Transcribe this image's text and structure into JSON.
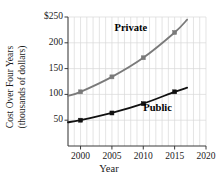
{
  "chart_data": {
    "type": "line",
    "title": "",
    "xlabel": "Year",
    "ylabel": "Cost Over Four Years (thousands of dollars)",
    "ylabel_line1": "Cost Over Four Years",
    "ylabel_line2": "(thousands of dollars)",
    "xlim": [
      1998,
      2020
    ],
    "ylim": [
      0,
      250
    ],
    "x_ticks": [
      2000,
      2005,
      2010,
      2015,
      2020
    ],
    "x_tick_labels": [
      "2000",
      "2005",
      "2010",
      "2015",
      "2020"
    ],
    "y_ticks": [
      50,
      100,
      150,
      200,
      250
    ],
    "y_tick_labels": [
      "50",
      "100",
      "150",
      "200",
      "$250"
    ],
    "grid": "vertical yearly gridlines and horizontal gridlines at major ticks",
    "legend_position": "inline labels on curves",
    "series": [
      {
        "name": "Private",
        "color": "#7a7a7a",
        "label": "Private",
        "label_x": 2008.6,
        "label_y": 228,
        "marker": "square",
        "x": [
          1998,
          2000,
          2005,
          2010,
          2015,
          2017
        ],
        "values": [
          97,
          105,
          134,
          171,
          220,
          245
        ],
        "markers_x": [
          2000,
          2005,
          2010,
          2015
        ],
        "markers_y": [
          105,
          134,
          171,
          220
        ]
      },
      {
        "name": "Public",
        "color": "#111111",
        "label": "Public",
        "label_x": 2013.2,
        "label_y": 74,
        "marker": "square",
        "x": [
          1998,
          2000,
          2005,
          2010,
          2015,
          2017
        ],
        "values": [
          46,
          50,
          64,
          82,
          105,
          113
        ],
        "markers_x": [
          2000,
          2005,
          2010,
          2015
        ],
        "markers_y": [
          50,
          64,
          82,
          105
        ]
      }
    ],
    "axis_color": "#3a3a3a",
    "grid_color": "#d8d8d8"
  }
}
